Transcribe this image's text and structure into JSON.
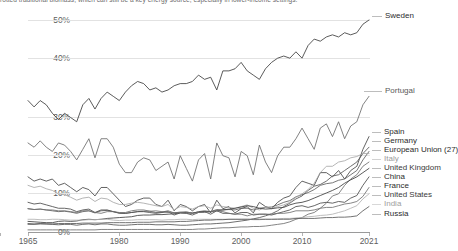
{
  "caption": {
    "text": "rotted traditional biomass, which can still be a key energy source, especially in lower-income settings."
  },
  "chart_data": {
    "type": "line",
    "title": "",
    "subtitle": "",
    "xlabel": "",
    "ylabel": "",
    "xlim": [
      1965,
      2021
    ],
    "ylim": [
      0,
      52
    ],
    "grid": true,
    "legend_position": "right-inline",
    "x_ticks": [
      "1965",
      "1980",
      "1990",
      "2000",
      "2010",
      "2021"
    ],
    "y_ticks": [
      "0%",
      "10%",
      "20%",
      "30%",
      "40%",
      "50%"
    ],
    "x": [
      1965,
      1966,
      1967,
      1968,
      1969,
      1970,
      1971,
      1972,
      1973,
      1974,
      1975,
      1976,
      1977,
      1978,
      1979,
      1980,
      1981,
      1982,
      1983,
      1984,
      1985,
      1986,
      1987,
      1988,
      1989,
      1990,
      1991,
      1992,
      1993,
      1994,
      1995,
      1996,
      1997,
      1998,
      1999,
      2000,
      2001,
      2002,
      2003,
      2004,
      2005,
      2006,
      2007,
      2008,
      2009,
      2010,
      2011,
      2012,
      2013,
      2014,
      2015,
      2016,
      2017,
      2018,
      2019,
      2020,
      2021
    ],
    "series": [
      {
        "name": "Sweden",
        "color": "#3d3d3d",
        "label_color": "#2b2b2b",
        "end_value": 50.0,
        "values": [
          31.0,
          29.5,
          31.0,
          30.0,
          28.0,
          26.5,
          28.0,
          27.0,
          26.0,
          30.0,
          31.5,
          29.0,
          31.5,
          33.0,
          32.0,
          31.0,
          33.0,
          34.5,
          35.5,
          35.0,
          33.5,
          34.0,
          33.0,
          33.5,
          34.5,
          35.0,
          35.0,
          35.5,
          37.0,
          36.0,
          36.5,
          33.5,
          38.0,
          38.0,
          38.5,
          40.0,
          38.0,
          37.0,
          36.0,
          38.5,
          40.0,
          41.0,
          41.5,
          41.0,
          42.5,
          41.0,
          44.0,
          45.5,
          45.0,
          46.0,
          46.5,
          46.0,
          47.0,
          46.5,
          47.0,
          49.0,
          50.0
        ]
      },
      {
        "name": "Portugal",
        "color": "#6b6b6b",
        "label_color": "#5a5a5a",
        "end_value": 32.0,
        "values": [
          21.0,
          20.0,
          21.5,
          20.0,
          19.0,
          21.0,
          20.5,
          19.0,
          17.0,
          19.5,
          22.0,
          17.5,
          22.0,
          22.0,
          20.0,
          16.0,
          14.0,
          14.0,
          16.5,
          17.5,
          17.0,
          14.5,
          15.5,
          16.5,
          12.5,
          18.0,
          15.0,
          12.0,
          17.0,
          18.5,
          12.5,
          21.0,
          18.0,
          17.5,
          13.0,
          19.0,
          18.0,
          13.5,
          20.5,
          16.5,
          14.0,
          18.0,
          20.0,
          20.0,
          22.0,
          24.5,
          22.0,
          19.5,
          24.5,
          25.5,
          22.5,
          26.0,
          22.0,
          25.0,
          26.0,
          30.0,
          32.0
        ]
      },
      {
        "name": "Spain",
        "color": "#474747",
        "label_color": "#2b2b2b",
        "end_value": 22.5,
        "values": [
          13.0,
          12.0,
          12.5,
          12.0,
          12.5,
          11.0,
          11.5,
          10.5,
          9.5,
          10.5,
          10.0,
          8.5,
          10.5,
          10.5,
          9.0,
          7.5,
          6.0,
          6.5,
          7.5,
          8.0,
          8.0,
          6.5,
          6.0,
          7.5,
          5.0,
          6.5,
          6.0,
          5.0,
          6.0,
          6.5,
          4.5,
          7.5,
          5.5,
          6.0,
          4.5,
          5.5,
          6.0,
          4.5,
          7.0,
          6.0,
          5.5,
          7.0,
          8.0,
          8.5,
          10.5,
          12.0,
          11.5,
          11.0,
          14.0,
          14.0,
          13.0,
          14.5,
          12.5,
          14.5,
          15.5,
          19.5,
          22.5
        ]
      },
      {
        "name": "Germany",
        "color": "#555555",
        "label_color": "#2b2b2b",
        "end_value": 20.0,
        "values": [
          2.0,
          1.9,
          2.0,
          1.9,
          1.8,
          1.7,
          1.8,
          1.8,
          1.6,
          1.8,
          1.9,
          1.7,
          1.9,
          1.9,
          1.7,
          1.6,
          1.6,
          1.7,
          1.8,
          1.8,
          1.8,
          1.7,
          1.7,
          1.8,
          1.7,
          1.6,
          1.6,
          1.7,
          1.8,
          1.9,
          1.9,
          2.0,
          2.1,
          2.2,
          2.4,
          2.6,
          2.8,
          3.1,
          3.4,
          3.8,
          4.3,
          5.0,
          6.0,
          6.8,
          7.8,
          8.5,
          9.8,
          10.8,
          11.2,
          12.0,
          13.2,
          13.5,
          14.5,
          15.5,
          16.5,
          18.5,
          20.0
        ]
      },
      {
        "name": "European Union (27)",
        "color": "#5f5f5f",
        "label_color": "#2b2b2b",
        "end_value": 19.0,
        "values": [
          5.5,
          5.3,
          5.4,
          5.2,
          5.0,
          4.8,
          4.9,
          4.7,
          4.4,
          4.8,
          5.0,
          4.5,
          5.0,
          5.1,
          4.8,
          4.5,
          4.4,
          4.6,
          4.8,
          4.9,
          4.9,
          4.6,
          4.7,
          5.0,
          4.5,
          4.7,
          4.6,
          4.4,
          4.8,
          5.0,
          4.8,
          5.3,
          5.2,
          5.3,
          5.2,
          5.6,
          5.6,
          5.2,
          5.6,
          5.8,
          5.9,
          6.4,
          7.0,
          7.4,
          8.3,
          8.8,
          9.3,
          10.0,
          11.0,
          11.4,
          11.6,
          12.2,
          12.5,
          13.5,
          14.5,
          17.0,
          19.0
        ]
      },
      {
        "name": "Italy",
        "color": "#a8a8a8",
        "label_color": "#9a9a9a",
        "end_value": 18.5,
        "values": [
          11.0,
          10.5,
          10.8,
          10.2,
          9.8,
          9.0,
          8.8,
          8.2,
          7.5,
          8.0,
          8.2,
          7.2,
          8.0,
          7.8,
          7.0,
          6.5,
          6.5,
          6.8,
          7.0,
          6.8,
          6.5,
          6.2,
          6.0,
          6.5,
          5.2,
          6.0,
          5.8,
          5.4,
          6.0,
          6.2,
          5.6,
          6.4,
          6.0,
          5.8,
          5.6,
          6.0,
          6.4,
          5.6,
          5.2,
          5.8,
          5.6,
          6.0,
          6.4,
          7.0,
          8.2,
          9.0,
          10.0,
          11.5,
          14.0,
          15.5,
          15.5,
          16.5,
          16.8,
          17.5,
          17.8,
          18.5,
          18.5
        ]
      },
      {
        "name": "United Kingdom",
        "color": "#6f6f6f",
        "label_color": "#3a3a3a",
        "end_value": 16.5,
        "values": [
          0.5,
          0.5,
          0.5,
          0.5,
          0.5,
          0.5,
          0.5,
          0.5,
          0.5,
          0.5,
          0.5,
          0.5,
          0.6,
          0.6,
          0.6,
          0.6,
          0.6,
          0.6,
          0.6,
          0.6,
          0.6,
          0.6,
          0.6,
          0.6,
          0.6,
          0.6,
          0.6,
          0.6,
          0.7,
          0.7,
          0.8,
          0.9,
          1.0,
          1.0,
          1.1,
          1.2,
          1.2,
          1.3,
          1.3,
          1.4,
          1.6,
          1.8,
          2.0,
          2.4,
          3.0,
          3.4,
          4.2,
          4.6,
          5.6,
          6.8,
          8.5,
          9.0,
          11.0,
          12.5,
          13.5,
          15.5,
          16.5
        ]
      },
      {
        "name": "China",
        "color": "#3f3f3f",
        "label_color": "#2b2b2b",
        "end_value": 15.0,
        "values": [
          2.5,
          2.4,
          2.3,
          2.2,
          2.2,
          2.5,
          2.6,
          2.5,
          2.6,
          2.9,
          3.0,
          2.9,
          3.0,
          3.2,
          3.3,
          3.4,
          3.5,
          3.6,
          3.9,
          4.0,
          4.0,
          4.1,
          4.1,
          4.2,
          4.3,
          4.5,
          4.5,
          4.5,
          4.7,
          4.8,
          4.8,
          5.0,
          5.2,
          5.4,
          5.6,
          5.9,
          6.2,
          6.0,
          5.6,
          5.4,
          5.5,
          5.7,
          5.8,
          6.4,
          6.8,
          7.0,
          7.4,
          8.0,
          8.6,
          9.2,
          9.8,
          10.5,
          11.5,
          12.3,
          13.0,
          14.0,
          15.0
        ]
      },
      {
        "name": "France",
        "color": "#4b4b4b",
        "label_color": "#2b2b2b",
        "end_value": 13.0,
        "values": [
          7.0,
          6.6,
          6.8,
          6.4,
          6.0,
          5.6,
          5.6,
          5.4,
          4.8,
          5.2,
          5.4,
          4.6,
          5.2,
          5.2,
          4.8,
          4.4,
          4.4,
          4.6,
          4.8,
          4.8,
          4.6,
          4.4,
          4.6,
          4.8,
          4.0,
          4.5,
          4.4,
          4.0,
          4.6,
          4.8,
          4.2,
          5.0,
          4.4,
          4.4,
          4.2,
          4.6,
          4.6,
          4.0,
          4.2,
          4.2,
          4.0,
          4.4,
          4.8,
          5.2,
          6.0,
          6.2,
          5.8,
          6.2,
          6.8,
          7.0,
          6.8,
          7.2,
          7.0,
          8.0,
          8.6,
          11.0,
          13.0
        ]
      },
      {
        "name": "United States",
        "color": "#707070",
        "label_color": "#3a3a3a",
        "end_value": 10.5,
        "values": [
          5.5,
          5.3,
          5.4,
          5.2,
          5.2,
          5.0,
          5.0,
          4.8,
          4.6,
          5.0,
          5.0,
          4.6,
          4.4,
          4.8,
          4.8,
          4.6,
          4.6,
          5.0,
          5.2,
          5.2,
          4.9,
          5.0,
          4.8,
          4.6,
          4.6,
          4.6,
          4.8,
          4.4,
          4.6,
          4.6,
          4.8,
          5.0,
          4.8,
          4.4,
          4.2,
          4.2,
          3.8,
          4.2,
          4.2,
          4.2,
          4.2,
          4.4,
          4.4,
          4.6,
          5.0,
          5.0,
          5.0,
          5.2,
          5.6,
          5.8,
          5.8,
          6.2,
          6.6,
          6.8,
          7.2,
          8.4,
          10.5
        ]
      },
      {
        "name": "India",
        "color": "#b2b2b2",
        "label_color": "#a0a0a0",
        "end_value": 9.0,
        "values": [
          3.0,
          3.0,
          2.9,
          2.9,
          3.0,
          3.0,
          2.9,
          2.8,
          2.8,
          2.8,
          2.9,
          2.9,
          3.0,
          3.0,
          2.8,
          2.7,
          2.8,
          2.8,
          2.9,
          2.9,
          2.9,
          2.9,
          2.8,
          2.9,
          2.9,
          3.0,
          3.0,
          2.9,
          3.0,
          3.0,
          3.0,
          3.0,
          3.0,
          3.0,
          3.0,
          3.0,
          3.0,
          2.9,
          2.9,
          3.0,
          3.0,
          3.1,
          3.2,
          3.2,
          3.3,
          3.4,
          3.6,
          3.7,
          3.9,
          4.0,
          4.2,
          4.6,
          5.0,
          5.6,
          6.2,
          7.8,
          9.0
        ]
      },
      {
        "name": "Russia",
        "color": "#5a5a5a",
        "label_color": "#2b2b2b",
        "end_value": 6.0,
        "values": [
          1.8,
          1.8,
          1.9,
          1.9,
          1.9,
          2.0,
          2.0,
          2.0,
          2.0,
          2.1,
          2.1,
          2.1,
          2.1,
          2.2,
          2.2,
          2.2,
          2.2,
          2.2,
          2.3,
          2.3,
          2.3,
          2.4,
          2.4,
          2.4,
          2.4,
          2.5,
          2.5,
          2.6,
          2.7,
          2.8,
          2.8,
          2.9,
          2.9,
          3.0,
          3.0,
          3.0,
          3.0,
          3.0,
          3.0,
          3.0,
          3.0,
          3.0,
          3.0,
          3.0,
          3.2,
          3.2,
          3.2,
          3.2,
          3.3,
          3.4,
          3.4,
          3.5,
          3.5,
          3.6,
          3.8,
          5.0,
          6.0
        ]
      }
    ]
  },
  "labels": {
    "sweden": "Sweden",
    "portugal": "Portugal",
    "spain": "Spain",
    "germany": "Germany",
    "european_union": "European Union (27)",
    "italy": "Italy",
    "united_kingdom": "United Kingdom",
    "china": "China",
    "france": "France",
    "united_states": "United States",
    "india": "India",
    "russia": "Russia"
  },
  "axis": {
    "y0": "0%",
    "y1": "10%",
    "y2": "20%",
    "y3": "30%",
    "y4": "40%",
    "y5": "50%",
    "x0": "1965",
    "x1": "1980",
    "x2": "1990",
    "x3": "2000",
    "x4": "2010",
    "x5": "2021"
  }
}
